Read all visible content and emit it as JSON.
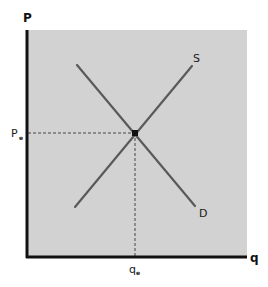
{
  "diagram": {
    "type": "supply-demand",
    "axes": {
      "y_label": "P",
      "x_label": "q"
    },
    "curves": [
      {
        "name": "supply",
        "label": "S",
        "from": [
          75,
          207
        ],
        "to": [
          192,
          66
        ]
      },
      {
        "name": "demand",
        "label": "D",
        "from": [
          77,
          65
        ],
        "to": [
          195,
          206
        ]
      }
    ],
    "equilibrium": {
      "point": [
        135,
        133
      ],
      "price_label": "P",
      "price_subscript": "e",
      "quantity_label": "q",
      "quantity_subscript": "e"
    },
    "colors": {
      "plot_background": "#d2d2d2",
      "axis": "#111111",
      "curve": "#5a5a5a",
      "guide": "#444444",
      "point": "#111111"
    }
  }
}
